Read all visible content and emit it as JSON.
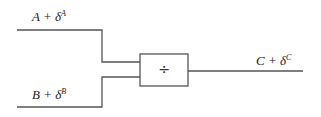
{
  "diagram": {
    "inputs": [
      {
        "base": "A + δ",
        "sup": "A"
      },
      {
        "base": "B + δ",
        "sup": "B"
      }
    ],
    "operator": {
      "symbol": "÷",
      "name": "divide"
    },
    "output": {
      "base": "C + δ",
      "sup": "C"
    },
    "colors": {
      "line": "#555555",
      "text": "#222222"
    }
  }
}
